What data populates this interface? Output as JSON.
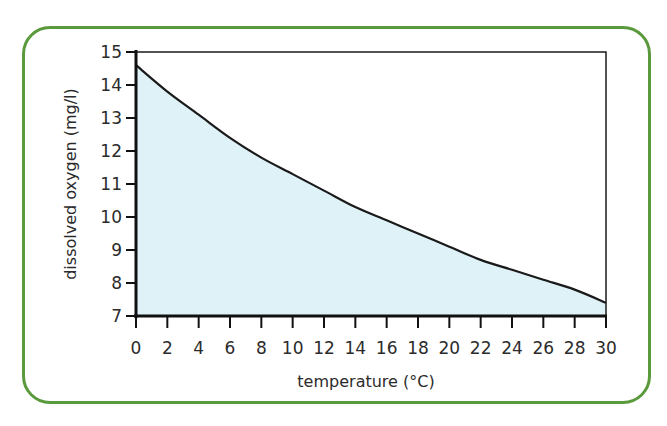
{
  "chart_data": {
    "type": "area",
    "title": "",
    "xlabel": "temperature (°C)",
    "ylabel": "dissolved oxygen (mg/l)",
    "xlim": [
      0,
      30
    ],
    "ylim": [
      7,
      15
    ],
    "x_ticks": [
      0,
      2,
      4,
      6,
      8,
      10,
      12,
      14,
      16,
      18,
      20,
      22,
      24,
      26,
      28,
      30
    ],
    "y_ticks": [
      7,
      8,
      9,
      10,
      11,
      12,
      13,
      14,
      15
    ],
    "grid": false,
    "legend": null,
    "x": [
      0,
      2,
      4,
      6,
      8,
      10,
      12,
      14,
      16,
      18,
      20,
      22,
      24,
      26,
      28,
      30
    ],
    "series": [
      {
        "name": "dissolved oxygen",
        "values": [
          14.6,
          13.8,
          13.1,
          12.4,
          11.8,
          11.3,
          10.8,
          10.3,
          9.9,
          9.5,
          9.1,
          8.7,
          8.4,
          8.1,
          7.8,
          7.4
        ]
      }
    ],
    "colors": {
      "fill": "#dff2f8",
      "line": "#1a1a1a",
      "frame": "#5a9a3c"
    }
  }
}
